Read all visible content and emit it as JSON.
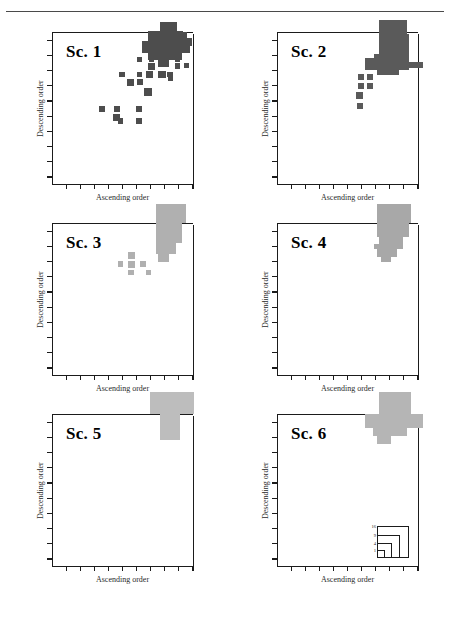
{
  "figure": {
    "type": "multi-panel-scatter",
    "panel_count": 6,
    "axis_labels": {
      "x": "Ascending order",
      "y": "Descending order"
    },
    "tick_count": {
      "x": 10,
      "y": 10
    },
    "colors": {
      "axis": "#1b1b1b",
      "rule": "#4a4a4a",
      "dark_gray": "#4d4d4d",
      "mid_gray": "#6e6e6e",
      "light_gray": "#b0b0b0",
      "background": "#ffffff"
    }
  },
  "legend": {
    "title": "",
    "labels": [
      "16",
      "9",
      "4",
      "1"
    ],
    "description": "nested squares sized by count"
  },
  "chart_data": {
    "type": "scatter",
    "title": "",
    "xlabel": "Ascending order",
    "ylabel": "Descending order",
    "xlim": [
      0,
      10
    ],
    "ylim": [
      0,
      10
    ],
    "grid": false,
    "legend_position": "bottom-right of panel 6",
    "marker_encoding": "square area proportional to count; legend sizes 1, 4, 9, 16",
    "panels": [
      {
        "name": "Sc. 1",
        "color": "#4d4d4d",
        "points": [
          {
            "x": 9.35,
            "y": 9.8,
            "size": 9
          },
          {
            "x": 9.05,
            "y": 9.35,
            "size": 16
          },
          {
            "x": 9.6,
            "y": 9.35,
            "size": 16
          },
          {
            "x": 9.3,
            "y": 8.95,
            "size": 4
          },
          {
            "x": 8.9,
            "y": 8.2,
            "size": 4
          },
          {
            "x": 9.55,
            "y": 7.8,
            "size": 4
          },
          {
            "x": 8.9,
            "y": 7.75,
            "size": 4
          },
          {
            "x": 6.2,
            "y": 8.2,
            "size": 4
          },
          {
            "x": 7.05,
            "y": 8.2,
            "size": 4
          },
          {
            "x": 7.05,
            "y": 7.7,
            "size": 9
          },
          {
            "x": 4.95,
            "y": 7.2,
            "size": 4
          },
          {
            "x": 6.2,
            "y": 7.2,
            "size": 4
          },
          {
            "x": 6.9,
            "y": 7.2,
            "size": 9
          },
          {
            "x": 7.8,
            "y": 7.2,
            "size": 9
          },
          {
            "x": 8.35,
            "y": 7.2,
            "size": 4
          },
          {
            "x": 8.4,
            "y": 6.95,
            "size": 4
          },
          {
            "x": 5.55,
            "y": 6.7,
            "size": 9
          },
          {
            "x": 6.25,
            "y": 6.7,
            "size": 4
          },
          {
            "x": 6.8,
            "y": 6.05,
            "size": 16
          },
          {
            "x": 3.55,
            "y": 4.95,
            "size": 4
          },
          {
            "x": 4.6,
            "y": 4.95,
            "size": 4
          },
          {
            "x": 6.15,
            "y": 4.95,
            "size": 4
          },
          {
            "x": 4.55,
            "y": 4.4,
            "size": 9
          },
          {
            "x": 4.85,
            "y": 4.15,
            "size": 4
          },
          {
            "x": 6.15,
            "y": 4.15,
            "size": 4
          }
        ],
        "cluster": "large dark cluster at top-right corner overflowing the axes"
      },
      {
        "name": "Sc. 2",
        "color": "#5a5a5a",
        "points": [
          {
            "x": 7.1,
            "y": 8.35,
            "size": 4
          },
          {
            "x": 7.55,
            "y": 8.35,
            "size": 4
          },
          {
            "x": 6.6,
            "y": 7.85,
            "size": 9
          },
          {
            "x": 5.95,
            "y": 7.05,
            "size": 4
          },
          {
            "x": 6.6,
            "y": 7.05,
            "size": 4
          },
          {
            "x": 5.95,
            "y": 6.45,
            "size": 4
          },
          {
            "x": 6.6,
            "y": 6.45,
            "size": 4
          },
          {
            "x": 5.85,
            "y": 5.85,
            "size": 9
          },
          {
            "x": 5.9,
            "y": 5.15,
            "size": 4
          }
        ],
        "cluster": "large dark cluster at top-right corner overflowing the axes"
      },
      {
        "name": "Sc. 3",
        "color": "#b0b0b0",
        "points": [
          {
            "x": 5.65,
            "y": 7.85,
            "size": 9
          },
          {
            "x": 4.85,
            "y": 7.3,
            "size": 4
          },
          {
            "x": 5.65,
            "y": 7.3,
            "size": 9
          },
          {
            "x": 6.45,
            "y": 7.3,
            "size": 4
          },
          {
            "x": 5.6,
            "y": 6.75,
            "size": 4
          },
          {
            "x": 6.85,
            "y": 6.75,
            "size": 4
          }
        ],
        "cluster": "large light-gray cluster at top-right corner overflowing the axes"
      },
      {
        "name": "Sc. 4",
        "color": "#a8a8a8",
        "points": [
          {
            "x": 7.05,
            "y": 8.45,
            "size": 4
          }
        ],
        "cluster": "large light-gray cluster at top-right corner overflowing the axes"
      },
      {
        "name": "Sc. 5",
        "color": "#bdbdbd",
        "points": [],
        "cluster": "large light-gray cluster at top-right corner overflowing the axes"
      },
      {
        "name": "Sc. 6",
        "color": "#b5b5b5",
        "points": [],
        "cluster": "large light-gray cluster at top-right corner overflowing the axes"
      }
    ]
  }
}
